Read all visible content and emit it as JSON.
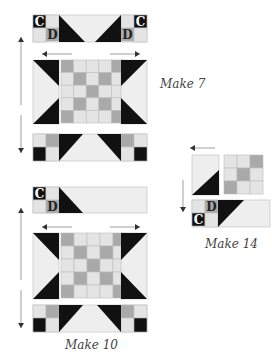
{
  "diagram": {
    "colors": {
      "dark": "#111111",
      "medium": "#a9a9a9",
      "light": "#e4e4e4",
      "background": "#eeeeee",
      "outline": "#bdbdbd",
      "arrow": "#333333",
      "caption": "#444444"
    },
    "labels": {
      "c": "C",
      "d": "D"
    },
    "captions": {
      "block_a": "Make 7",
      "block_b": "Make 10",
      "block_c": "Make 14"
    },
    "grid_pattern": [
      [
        "M",
        "L",
        "L",
        "L",
        "M"
      ],
      [
        "L",
        "M",
        "L",
        "M",
        "L"
      ],
      [
        "L",
        "L",
        "M",
        "L",
        "L"
      ],
      [
        "L",
        "M",
        "L",
        "M",
        "L"
      ],
      [
        "M",
        "L",
        "L",
        "L",
        "M"
      ]
    ],
    "small_grid_pattern": [
      [
        "L",
        "L",
        "M"
      ],
      [
        "L",
        "M",
        "L"
      ],
      [
        "M",
        "L",
        "L"
      ]
    ],
    "pressing_arrows": {
      "block_a": [
        "up",
        "left",
        "right",
        "down"
      ],
      "block_b": [
        "up",
        "left",
        "right",
        "down"
      ],
      "block_c": [
        "left",
        "down"
      ]
    }
  }
}
